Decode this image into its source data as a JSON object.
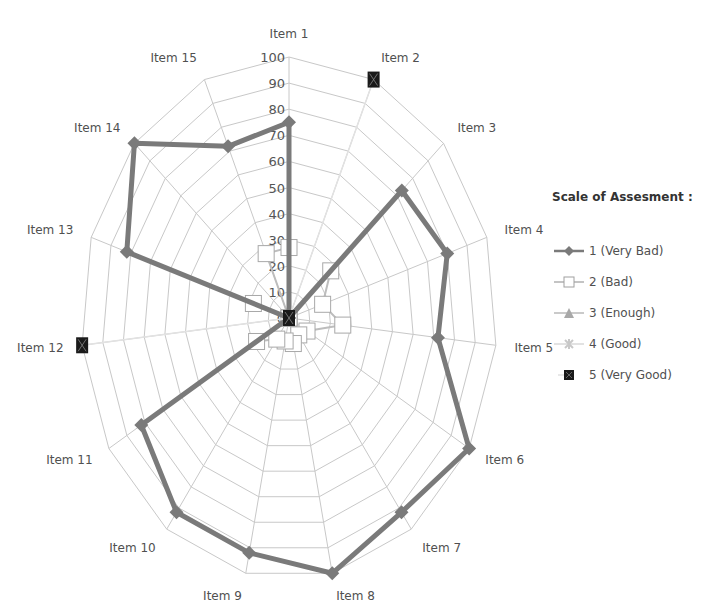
{
  "chart_data": {
    "type": "radar",
    "title": "",
    "categories": [
      "Item 1",
      "Item 2",
      "Item 3",
      "Item 4",
      "Item 5",
      "Item 6",
      "Item 7",
      "Item 8",
      "Item 9",
      "Item 10",
      "Item 11",
      "Item 12",
      "Item 13",
      "Item 14",
      "Item 15"
    ],
    "rlim": [
      0,
      100
    ],
    "rticks": [
      0,
      10,
      20,
      30,
      40,
      50,
      60,
      70,
      80,
      90,
      100
    ],
    "grid": true,
    "legend_position": "right",
    "legend_title": "Scale of Assesment :",
    "series": [
      {
        "name": "1 (Very Bad)",
        "marker": "diamond",
        "color": "#7a7a7a",
        "values": [
          75,
          0,
          73,
          80,
          72,
          100,
          92,
          100,
          92,
          92,
          82,
          0,
          82,
          100,
          72
        ]
      },
      {
        "name": "2  (Bad)",
        "marker": "square-open",
        "color": "#b0b0b0",
        "values": [
          27,
          0,
          27,
          17,
          26,
          10,
          8,
          10,
          9,
          10,
          18,
          0,
          18,
          0,
          27
        ]
      },
      {
        "name": "3 (Enough)",
        "marker": "triangle",
        "color": "#a8a8a8",
        "values": [
          0,
          0,
          0,
          0,
          0,
          0,
          0,
          0,
          0,
          0,
          0,
          0,
          0,
          0,
          0
        ]
      },
      {
        "name": "4 (Good)",
        "marker": "star",
        "color": "#d8d8d8",
        "values": [
          0,
          0,
          0,
          0,
          0,
          0,
          0,
          0,
          0,
          0,
          0,
          0,
          0,
          0,
          0
        ]
      },
      {
        "name": "5 (Very Good)",
        "marker": "square-filled",
        "color": "#1a1a1a",
        "values": [
          0,
          100,
          0,
          0,
          0,
          0,
          0,
          0,
          0,
          0,
          0,
          100,
          0,
          0,
          0
        ]
      }
    ]
  },
  "legend": {
    "title": "Scale of Assesment :",
    "items": [
      {
        "label": "1 (Very Bad)"
      },
      {
        "label": "2  (Bad)"
      },
      {
        "label": "3 (Enough)"
      },
      {
        "label": "4 (Good)"
      },
      {
        "label": "5 (Very Good)"
      }
    ]
  }
}
